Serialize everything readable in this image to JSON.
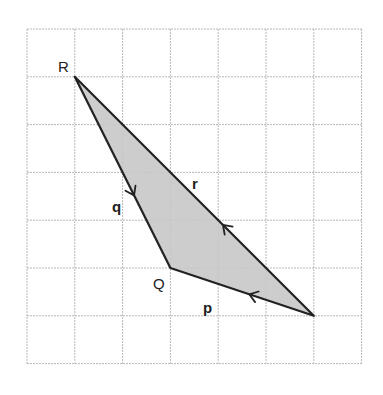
{
  "diagram": {
    "type": "vector-triangle-on-grid",
    "grid": {
      "cols": 7,
      "rows": 7,
      "line_color": "#b8b8b8",
      "background": "#ffffff"
    },
    "shape": {
      "fill": "#c8c8c8",
      "stroke": "#222222"
    },
    "vertices": [
      {
        "id": "R",
        "label": "R",
        "grid": [
          1,
          1
        ]
      },
      {
        "id": "Q",
        "label": "Q",
        "grid": [
          3,
          5
        ]
      },
      {
        "id": "P",
        "label": "",
        "grid": [
          6,
          6
        ]
      }
    ],
    "edges": [
      {
        "id": "q",
        "label": "q",
        "from": "R",
        "to": "Q",
        "arrow_direction": "R-to-Q"
      },
      {
        "id": "r",
        "label": "r",
        "from": "P",
        "to": "R",
        "arrow_direction": "P-to-R"
      },
      {
        "id": "p",
        "label": "p",
        "from": "P",
        "to": "Q",
        "arrow_direction": "P-to-Q"
      }
    ]
  },
  "labels": {
    "R": "R",
    "Q": "Q",
    "q": "q",
    "r": "r",
    "p": "p"
  }
}
